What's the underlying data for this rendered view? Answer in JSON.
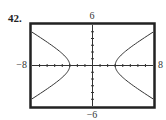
{
  "problem_number": "42.",
  "chart_data": {
    "type": "line",
    "title": "",
    "xlabel": "",
    "ylabel": "",
    "xlim": [
      -8,
      8
    ],
    "ylim": [
      -6,
      6
    ],
    "x_tick_step": 1,
    "y_tick_step": 1,
    "labels": {
      "xmin": "-8",
      "xmax": "8",
      "ymin": "-6",
      "ymax": "6"
    },
    "grid": false,
    "series": [
      {
        "name": "hyperbola",
        "equation": "x^2/9 - y^2/4 = 1",
        "a": 3,
        "b": 2
      }
    ]
  }
}
